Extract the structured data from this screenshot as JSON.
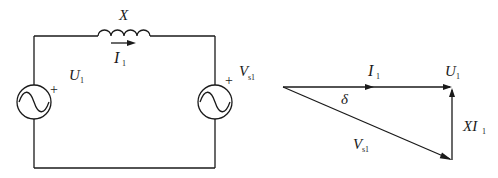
{
  "circuit": {
    "inductor": {
      "label": "X"
    },
    "current": {
      "symbol": "I",
      "subscript": "1"
    },
    "left_source": {
      "symbol": "U",
      "subscript": "1",
      "polarity": "+"
    },
    "right_source": {
      "symbol": "V",
      "subscript": "s1",
      "polarity": "+"
    }
  },
  "phasor": {
    "current": {
      "symbol": "I",
      "subscript": "1"
    },
    "voltage_u": {
      "symbol": "U",
      "subscript": "1"
    },
    "angle": {
      "symbol": "δ"
    },
    "voltage_v": {
      "symbol": "V",
      "subscript": "s1"
    },
    "drop": {
      "symbol": "XI",
      "subscript": "1"
    }
  },
  "colors": {
    "line": "#1a1a1a",
    "background": "#ffffff"
  }
}
